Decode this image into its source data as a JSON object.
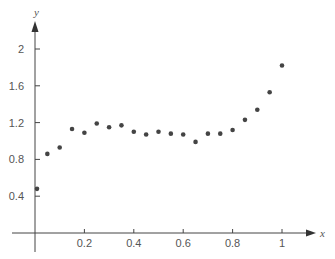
{
  "chart_data": {
    "type": "scatter",
    "title": "",
    "xlabel": "x",
    "ylabel": "y",
    "xlim": [
      -0.05,
      1.14
    ],
    "ylim": [
      -0.1,
      2.3
    ],
    "grid": false,
    "legend": null,
    "x_ticks": [
      0.2,
      0.4,
      0.6,
      0.8,
      1
    ],
    "x_tick_labels": [
      "0.2",
      "0.4",
      "0.6",
      "0.8",
      "1"
    ],
    "y_ticks": [
      0.4,
      0.8,
      1.2,
      1.6,
      2
    ],
    "y_tick_labels": [
      "0.4",
      "0.8",
      "1.2",
      "1.6",
      "2"
    ],
    "point_color": "#444444",
    "axis_color": "#444444",
    "series": [
      {
        "name": "data",
        "x": [
          0.0,
          0.05,
          0.1,
          0.15,
          0.2,
          0.25,
          0.3,
          0.35,
          0.4,
          0.45,
          0.5,
          0.55,
          0.6,
          0.65,
          0.7,
          0.75,
          0.8,
          0.85,
          0.9,
          0.95,
          1.0
        ],
        "y": [
          0.48,
          0.86,
          0.93,
          1.13,
          1.09,
          1.19,
          1.15,
          1.17,
          1.1,
          1.07,
          1.1,
          1.08,
          1.07,
          0.99,
          1.08,
          1.08,
          1.12,
          1.23,
          1.34,
          1.53,
          1.82
        ]
      }
    ]
  }
}
